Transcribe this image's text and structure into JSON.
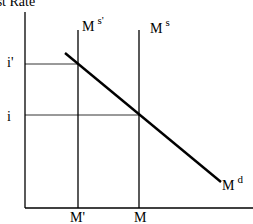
{
  "diagram": {
    "title": "Interest Rate",
    "title_visible": "t Rate",
    "y_axis_label": "Interest Rate",
    "x_axis_ticks": [
      {
        "label": "M'",
        "x": 78
      },
      {
        "label": "M",
        "x": 139
      }
    ],
    "y_axis_ticks": [
      {
        "label": "i'",
        "y": 64
      },
      {
        "label": "i",
        "y": 115
      }
    ],
    "curves": {
      "money_supply_new": {
        "base": "M",
        "sup": "s'"
      },
      "money_supply": {
        "base": "M",
        "sup": "s"
      },
      "money_demand": {
        "base": "M",
        "sup": "d"
      }
    },
    "colors": {
      "line": "#000000",
      "background": "#ffffff"
    }
  }
}
